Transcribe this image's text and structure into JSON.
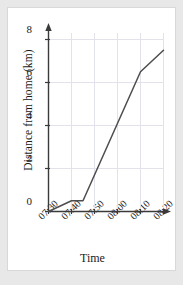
{
  "chart_data": {
    "type": "line",
    "title": "",
    "xlabel": "Time",
    "ylabel": "Distance from home (km)",
    "x_tick_labels": [
      "07:30",
      "07:40",
      "07:50",
      "08:00",
      "08:10",
      "08:20"
    ],
    "y_tick_labels": [
      "0",
      "2",
      "4",
      "6",
      "8"
    ],
    "y_ticks": [
      0,
      2,
      4,
      6,
      8
    ],
    "ylim": [
      0,
      8.6
    ],
    "xlim_minutes": [
      0,
      55
    ],
    "grid": true,
    "grid_color": "#e0e0e8",
    "line_color": "#4d4d4d",
    "legend": "none",
    "series": [
      {
        "name": "journey",
        "points": [
          {
            "time": "07:30",
            "minutes": 0,
            "distance_km": 0
          },
          {
            "time": "07:40",
            "minutes": 10,
            "distance_km": 0.5
          },
          {
            "time": "07:45",
            "minutes": 15,
            "distance_km": 0.5
          },
          {
            "time": "08:10",
            "minutes": 40,
            "distance_km": 6.5
          },
          {
            "time": "08:20",
            "minutes": 50,
            "distance_km": 7.5
          }
        ]
      }
    ]
  },
  "axes": {
    "y_axis_name": "distance-axis",
    "x_axis_name": "time-axis",
    "arrowheads": true
  }
}
